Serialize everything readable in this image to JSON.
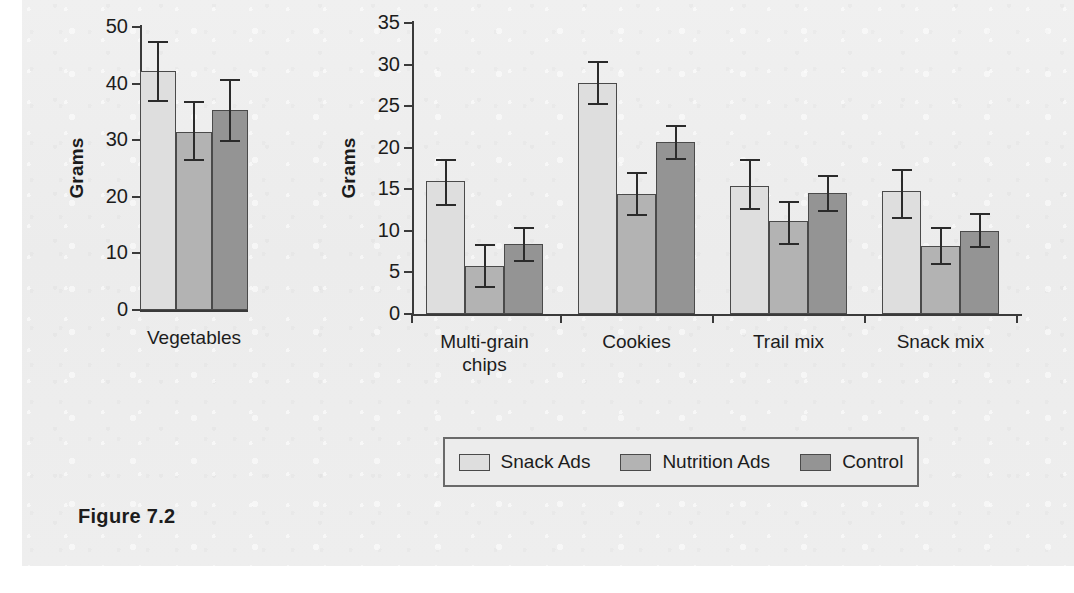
{
  "figure": {
    "caption": "Figure 7.2"
  },
  "legend": {
    "position": "bottom-center",
    "entries": [
      {
        "label": "Snack Ads",
        "color": "#dedede"
      },
      {
        "label": "Nutrition Ads",
        "color": "#b3b3b3"
      },
      {
        "label": "Control",
        "color": "#949494"
      }
    ]
  },
  "chart_data": [
    {
      "id": "vegetables-panel",
      "type": "bar",
      "title": "",
      "xlabel": "",
      "ylabel": "Grams",
      "ylim": [
        0,
        50
      ],
      "yticks": [
        0,
        10,
        20,
        30,
        40,
        50
      ],
      "ytick_labels": [
        "0",
        "10",
        "20",
        "30",
        "40",
        "50"
      ],
      "grid": false,
      "categories": [
        "Vegetables"
      ],
      "series": [
        {
          "name": "Snack Ads",
          "color": "#dedede",
          "values": [
            42.3
          ],
          "err_low": [
            37.0
          ],
          "err_high": [
            47.4
          ]
        },
        {
          "name": "Nutrition Ads",
          "color": "#b3b3b3",
          "values": [
            31.4
          ],
          "err_low": [
            26.5
          ],
          "err_high": [
            36.8
          ]
        },
        {
          "name": "Control",
          "color": "#949494",
          "values": [
            35.3
          ],
          "err_low": [
            29.9
          ],
          "err_high": [
            40.6
          ]
        }
      ]
    },
    {
      "id": "snack-foods-panel",
      "type": "bar",
      "title": "",
      "xlabel": "",
      "ylabel": "Grams",
      "ylim": [
        0,
        35
      ],
      "yticks": [
        0,
        5,
        10,
        15,
        20,
        25,
        30,
        35
      ],
      "ytick_labels": [
        "0",
        "5",
        "10",
        "15",
        "20",
        "25",
        "30",
        "35"
      ],
      "grid": false,
      "categories": [
        "Multi-grain\nchips",
        "Cookies",
        "Trail mix",
        "Snack mix"
      ],
      "series": [
        {
          "name": "Snack Ads",
          "color": "#dedede",
          "values": [
            16.0,
            27.8,
            15.4,
            14.8
          ],
          "err_low": [
            13.1,
            25.2,
            12.6,
            11.6
          ],
          "err_high": [
            18.5,
            30.3,
            18.5,
            17.3
          ]
        },
        {
          "name": "Nutrition Ads",
          "color": "#b3b3b3",
          "values": [
            5.8,
            14.4,
            11.2,
            8.2
          ],
          "err_low": [
            3.2,
            11.9,
            8.4,
            6.0
          ],
          "err_high": [
            8.3,
            16.9,
            13.5,
            10.4
          ]
        },
        {
          "name": "Control",
          "color": "#949494",
          "values": [
            8.4,
            20.7,
            14.5,
            10.0
          ],
          "err_low": [
            6.4,
            18.7,
            12.4,
            8.0
          ],
          "err_high": [
            10.3,
            22.6,
            16.6,
            12.0
          ]
        }
      ]
    }
  ]
}
